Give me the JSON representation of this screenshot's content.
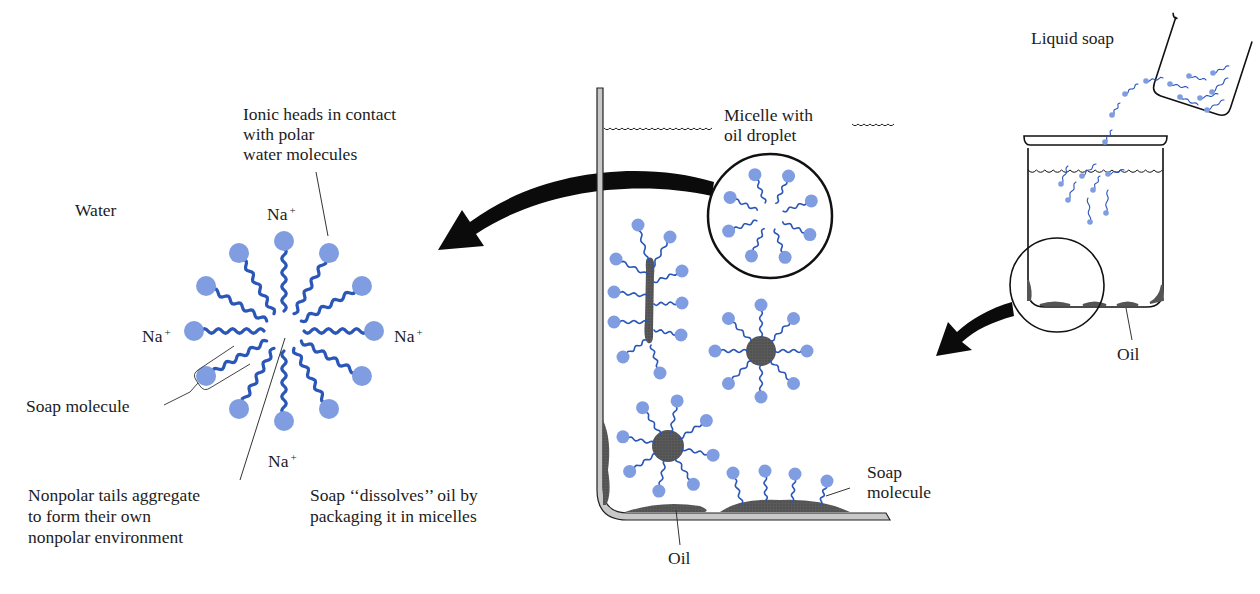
{
  "colors": {
    "head": "#7f9de0",
    "tail": "#2a56b8",
    "oil": "#555555",
    "wall_fill": "#c8c8c8",
    "outline": "#111111"
  },
  "labels": {
    "ionic_heads": [
      "Ionic heads in contact",
      "with polar",
      "water molecules"
    ],
    "water": "Water",
    "na_top": "Na",
    "na_left": "Na",
    "na_right": "Na",
    "na_bottom": "Na",
    "na_charge": "+",
    "soap_molecule_left": "Soap molecule",
    "nonpolar_tails": [
      "Nonpolar tails aggregate",
      "to form their own",
      "nonpolar environment"
    ],
    "soap_dissolves": [
      "Soap ‘‘dissolves’’ oil by",
      "packaging it in micelles"
    ],
    "micelle_with_oil": [
      "Micelle  with",
      "oil droplet"
    ],
    "soap_molecule_right": [
      "Soap",
      "molecule"
    ],
    "oil_bottom": "Oil",
    "liquid_soap": "Liquid soap",
    "oil_beaker": "Oil"
  },
  "micelle_large": {
    "center": [
      284,
      331
    ],
    "molecule_count": 12,
    "radius": 90
  },
  "icons": [
    "curved-arrow-left-icon",
    "curved-arrow-down-left-icon",
    "magnifier-circle-icon"
  ]
}
